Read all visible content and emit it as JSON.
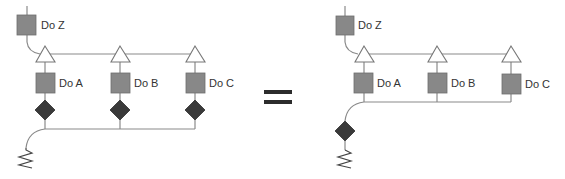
{
  "left": {
    "top_task": {
      "label": "Do Z"
    },
    "branches": [
      {
        "label": "Do A"
      },
      {
        "label": "Do B"
      },
      {
        "label": "Do C"
      }
    ]
  },
  "operator": {
    "symbol": "equals"
  },
  "right": {
    "top_task": {
      "label": "Do Z"
    },
    "branches": [
      {
        "label": "Do A"
      },
      {
        "label": "Do B"
      },
      {
        "label": "Do C"
      }
    ]
  },
  "colors": {
    "task_fill": "#888888",
    "decision_fill": "#3a3a3a",
    "wire": "#8a8a8a",
    "fork_fill": "#ffffff"
  }
}
